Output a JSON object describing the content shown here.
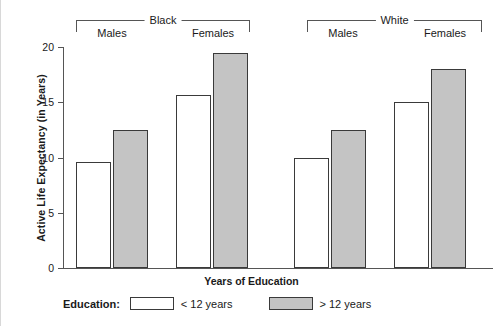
{
  "chart_data": {
    "type": "bar",
    "title": "",
    "xlabel": "Years of Education",
    "ylabel": "Active Life Expectancy (in Years)",
    "ylim": [
      0,
      20
    ],
    "yticks": [
      0,
      5,
      10,
      15,
      20
    ],
    "grid": false,
    "legend_position": "bottom-left",
    "legend_title": "Education:",
    "group_labels": [
      "Black",
      "White"
    ],
    "categories": [
      "Black Males",
      "Black Females",
      "White Males",
      "White Females"
    ],
    "subgroup_labels": [
      "Males",
      "Females",
      "Males",
      "Females"
    ],
    "series": [
      {
        "name": "< 12 years",
        "color": "#ffffff",
        "values": [
          9.6,
          15.7,
          10.0,
          15.0
        ]
      },
      {
        "name": "> 12 years",
        "color": "#c4c4c4",
        "values": [
          12.5,
          19.5,
          12.5,
          18.0
        ]
      }
    ]
  },
  "axes": {
    "y_title": "Active Life Expectancy (in Years)",
    "x_title": "Years of Education",
    "y_tick_labels": [
      "0",
      "5",
      "10",
      "15",
      "20"
    ]
  },
  "groups": [
    {
      "name": "Black",
      "sub": [
        "Males",
        "Females"
      ]
    },
    {
      "name": "White",
      "sub": [
        "Males",
        "Females"
      ]
    }
  ],
  "legend": {
    "title": "Education:",
    "items": [
      {
        "label": "< 12 years",
        "swatch": "light"
      },
      {
        "label": "> 12 years",
        "swatch": "dark"
      }
    ]
  }
}
